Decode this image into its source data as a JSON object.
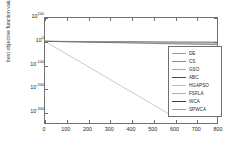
{
  "chart_data": {
    "type": "line",
    "title": "",
    "xlabel": "",
    "ylabel": "best objective function value",
    "yscale": "log",
    "xlim": [
      0,
      800
    ],
    "ylim_exp": [
      -350,
      100
    ],
    "grid": false,
    "legend_position": "center-right",
    "xticks": [
      "0",
      "100",
      "200",
      "300",
      "400",
      "500",
      "600",
      "700",
      "800"
    ],
    "xtick_values": [
      0,
      100,
      200,
      300,
      400,
      500,
      600,
      700,
      800
    ],
    "yticks": [
      {
        "mantissa": "10",
        "exponent": "100"
      },
      {
        "mantissa": "10",
        "exponent": "0"
      },
      {
        "mantissa": "10",
        "exponent": "-100"
      },
      {
        "mantissa": "10",
        "exponent": "-200"
      },
      {
        "mantissa": "10",
        "exponent": "-300"
      }
    ],
    "ytick_exponents": [
      100,
      0,
      -100,
      -200,
      -300
    ],
    "x": [
      0,
      50,
      100,
      150,
      200,
      250,
      300,
      350,
      400,
      450,
      500,
      550,
      600,
      650,
      700,
      750,
      800
    ],
    "series": [
      {
        "name": "DE",
        "color": "#9b9b9b",
        "log10_values": [
          0.0,
          -0.3,
          -0.6,
          -0.9,
          -1.2,
          -1.5,
          -1.8,
          -2.1,
          -2.4,
          -2.7,
          -3.0,
          -3.3,
          -3.6,
          -3.9,
          -4.2,
          -4.5,
          -4.8
        ]
      },
      {
        "name": "CS",
        "color": "#8c8c8c",
        "log10_values": [
          0.0,
          -0.5,
          -1.0,
          -1.5,
          -2.0,
          -2.5,
          -3.0,
          -3.5,
          -4.0,
          -4.5,
          -5.0,
          -5.5,
          -6.0,
          -6.5,
          -7.0,
          -7.5,
          -8.0
        ]
      },
      {
        "name": "GSO",
        "color": "#a8a8a8",
        "log10_values": [
          0.0,
          -0.4,
          -0.8,
          -1.2,
          -1.6,
          -2.0,
          -2.4,
          -2.8,
          -3.2,
          -3.6,
          -4.0,
          -4.4,
          -4.8,
          -5.2,
          -5.6,
          -6.0,
          -6.4
        ]
      },
      {
        "name": "ABC",
        "color": "#4a4a4a",
        "log10_values": [
          0.0,
          -0.2,
          -0.4,
          -0.6,
          -0.8,
          -1.0,
          -1.2,
          -1.4,
          -1.6,
          -1.8,
          -2.0,
          -2.2,
          -2.4,
          -2.6,
          -2.8,
          -3.0,
          -3.2
        ]
      },
      {
        "name": "HGAPSO",
        "color": "#bdbdbd",
        "log10_values": [
          0.0,
          -0.6,
          -1.2,
          -1.8,
          -2.4,
          -3.0,
          -3.6,
          -4.2,
          -4.8,
          -5.4,
          -6.0,
          -6.6,
          -7.2,
          -7.8,
          -8.4,
          -9.0,
          -9.6
        ]
      },
      {
        "name": "FSFLA",
        "color": "#b0b0b0",
        "log10_values": [
          0.0,
          -0.7,
          -1.4,
          -2.1,
          -2.8,
          -3.5,
          -4.2,
          -4.9,
          -5.6,
          -6.3,
          -7.0,
          -7.7,
          -8.4,
          -9.1,
          -9.8,
          -10.5,
          -11.2
        ]
      },
      {
        "name": "WCA",
        "color": "#3d3d3d",
        "log10_values": [
          0.0,
          -0.9,
          -1.8,
          -2.7,
          -3.6,
          -4.5,
          -5.4,
          -6.3,
          -7.2,
          -8.1,
          -9.0,
          -9.9,
          -10.8,
          -11.7,
          -12.6,
          -13.5,
          -14.4
        ]
      },
      {
        "name": "SPWCA",
        "color": "#9e9e9e",
        "log10_values": [
          0.0,
          -27.0,
          -54.0,
          -81.0,
          -108.0,
          -135.0,
          -162.0,
          -189.0,
          -216.0,
          -243.0,
          -270.0,
          -297.0,
          -324.0,
          null,
          null,
          null,
          null
        ]
      }
    ]
  }
}
